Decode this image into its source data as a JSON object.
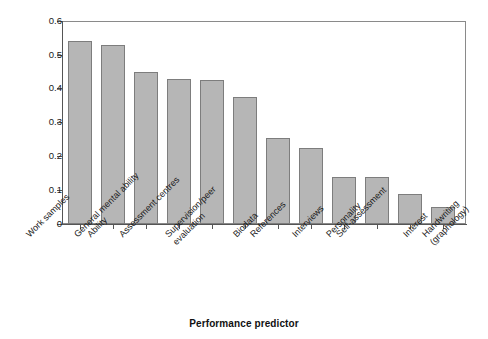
{
  "chart_data": {
    "type": "bar",
    "title": "",
    "xlabel": "Performance predictor",
    "ylabel": "",
    "ylim": [
      0,
      0.6
    ],
    "grid": false,
    "legend": null,
    "yticks": [
      "0",
      "0.1",
      "0.2",
      "0.3",
      "0.4",
      "0.5",
      "0.6"
    ],
    "ytick_values": [
      0,
      0.1,
      0.2,
      0.3,
      0.4,
      0.5,
      0.6
    ],
    "categories": [
      "Work samples",
      "Ability",
      "General mental ability",
      "Assessment centres",
      "Supervision/peer evaluation",
      "Biodata",
      "References",
      "Interviews",
      "Personality",
      "Self-assessment",
      "Interest",
      "Handwriting (graphology)"
    ],
    "values": [
      0.54,
      0.53,
      0.45,
      0.43,
      0.425,
      0.375,
      0.255,
      0.225,
      0.14,
      0.14,
      0.09,
      0.05
    ],
    "bar_fill": "#b6b6b6",
    "bar_stroke": "#7d7d7d",
    "axis_color": "#555555",
    "frame_color": "#8a8a8a"
  },
  "labels": {
    "cat0": "Work samples",
    "cat1": "Ability",
    "cat2": "General mental ability",
    "cat3": "Assessment centres",
    "cat4_line1": "Supervision/peer",
    "cat4_line2": "evaluation",
    "cat5": "Biodata",
    "cat6": "References",
    "cat7": "Interviews",
    "cat8": "Personality",
    "cat9": "Self-assessment",
    "cat10": "Interest",
    "cat11_line1": "Handwriting",
    "cat11_line2": "(graphology)"
  }
}
